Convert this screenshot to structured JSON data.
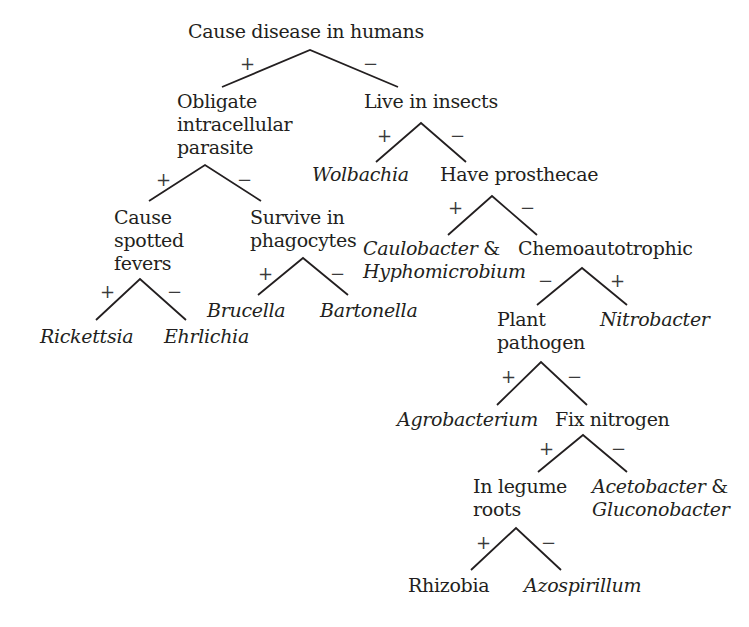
{
  "diagram": {
    "type": "binary-decision-tree",
    "title": "",
    "colors": {
      "text": "#231f20",
      "line": "#231f20",
      "background": "#ffffff"
    },
    "nodes": [
      {
        "id": "n_disease",
        "kind": "question",
        "lines": [
          "Cause disease in humans"
        ],
        "x": 188,
        "y": 20
      },
      {
        "id": "n_obligate",
        "kind": "question",
        "lines": [
          "Obligate",
          "intracellular",
          "parasite"
        ],
        "x": 177,
        "y": 90
      },
      {
        "id": "n_insects",
        "kind": "question",
        "lines": [
          "Live in insects"
        ],
        "x": 364,
        "y": 90
      },
      {
        "id": "n_wolbachia",
        "kind": "taxon",
        "lines": [
          "Wolbachia"
        ],
        "x": 312,
        "y": 163
      },
      {
        "id": "n_prosthecae",
        "kind": "question",
        "lines": [
          "Have prosthecae"
        ],
        "x": 440,
        "y": 163
      },
      {
        "id": "n_spotted",
        "kind": "question",
        "lines": [
          "Cause",
          "spotted",
          "fevers"
        ],
        "x": 114,
        "y": 206
      },
      {
        "id": "n_phagocytes",
        "kind": "question",
        "lines": [
          "Survive in",
          "phagocytes"
        ],
        "x": 250,
        "y": 206
      },
      {
        "id": "n_caulo",
        "kind": "taxon-pair",
        "lines": [
          "Caulobacter",
          "Hyphomicrobium"
        ],
        "suffix": " &",
        "x": 363,
        "y": 237
      },
      {
        "id": "n_chemo",
        "kind": "question",
        "lines": [
          "Chemoautotrophic"
        ],
        "x": 518,
        "y": 237
      },
      {
        "id": "n_brucella",
        "kind": "taxon",
        "lines": [
          "Brucella"
        ],
        "x": 207,
        "y": 299
      },
      {
        "id": "n_bartonella",
        "kind": "taxon",
        "lines": [
          "Bartonella"
        ],
        "x": 320,
        "y": 299
      },
      {
        "id": "n_plant",
        "kind": "question",
        "lines": [
          "Plant",
          "pathogen"
        ],
        "x": 497,
        "y": 308
      },
      {
        "id": "n_nitrobacter",
        "kind": "taxon",
        "lines": [
          "Nitrobacter"
        ],
        "x": 600,
        "y": 308
      },
      {
        "id": "n_rickettsia",
        "kind": "taxon",
        "lines": [
          "Rickettsia"
        ],
        "x": 40,
        "y": 325
      },
      {
        "id": "n_ehrlichia",
        "kind": "taxon",
        "lines": [
          "Ehrlichia"
        ],
        "x": 164,
        "y": 325
      },
      {
        "id": "n_agro",
        "kind": "taxon",
        "lines": [
          "Agrobacterium"
        ],
        "x": 397,
        "y": 408
      },
      {
        "id": "n_fix",
        "kind": "question",
        "lines": [
          "Fix nitrogen"
        ],
        "x": 555,
        "y": 408
      },
      {
        "id": "n_legume",
        "kind": "question",
        "lines": [
          "In legume",
          "roots"
        ],
        "x": 473,
        "y": 475
      },
      {
        "id": "n_aceto",
        "kind": "taxon-pair",
        "lines": [
          "Acetobacter",
          "Gluconobacter"
        ],
        "suffix": " &",
        "x": 592,
        "y": 475
      },
      {
        "id": "n_rhizobia",
        "kind": "group",
        "lines": [
          "Rhizobia"
        ],
        "x": 408,
        "y": 574
      },
      {
        "id": "n_azo",
        "kind": "taxon",
        "lines": [
          "Azospirillum"
        ],
        "x": 524,
        "y": 574
      }
    ],
    "forks": [
      {
        "parent": "n_disease",
        "apex": [
          310,
          50
        ],
        "left": [
          222,
          87
        ],
        "right": [
          398,
          87
        ],
        "left_sign": "+",
        "right_sign": "−",
        "left_child": "n_obligate",
        "right_child": "n_insects",
        "left_sign_pos": [
          240,
          55
        ],
        "right_sign_pos": [
          363,
          55
        ]
      },
      {
        "parent": "n_insects",
        "apex": [
          421,
          123
        ],
        "left": [
          376,
          162
        ],
        "right": [
          466,
          162
        ],
        "left_sign": "+",
        "right_sign": "−",
        "left_child": "n_wolbachia",
        "right_child": "n_prosthecae",
        "left_sign_pos": [
          377,
          127
        ],
        "right_sign_pos": [
          450,
          127
        ]
      },
      {
        "parent": "n_obligate",
        "apex": [
          205,
          165
        ],
        "left": [
          149,
          201
        ],
        "right": [
          261,
          201
        ],
        "left_sign": "+",
        "right_sign": "−",
        "left_child": "n_spotted",
        "right_child": "n_phagocytes",
        "left_sign_pos": [
          156,
          171
        ],
        "right_sign_pos": [
          237,
          171
        ]
      },
      {
        "parent": "n_prosthecae",
        "apex": [
          492,
          196
        ],
        "left": [
          448,
          235
        ],
        "right": [
          537,
          235
        ],
        "left_sign": "+",
        "right_sign": "−",
        "left_child": "n_caulo",
        "right_child": "n_chemo",
        "left_sign_pos": [
          448,
          199
        ],
        "right_sign_pos": [
          520,
          199
        ]
      },
      {
        "parent": "n_phagocytes",
        "apex": [
          303,
          258
        ],
        "left": [
          258,
          295
        ],
        "right": [
          348,
          295
        ],
        "left_sign": "+",
        "right_sign": "−",
        "left_child": "n_brucella",
        "right_child": "n_bartonella",
        "left_sign_pos": [
          258,
          265
        ],
        "right_sign_pos": [
          330,
          265
        ]
      },
      {
        "parent": "n_chemo",
        "apex": [
          582,
          268
        ],
        "left": [
          537,
          305
        ],
        "right": [
          627,
          305
        ],
        "left_sign": "−",
        "right_sign": "+",
        "left_child": "n_plant",
        "right_child": "n_nitrobacter",
        "left_sign_pos": [
          538,
          272
        ],
        "right_sign_pos": [
          610,
          272
        ]
      },
      {
        "parent": "n_spotted",
        "apex": [
          140,
          279
        ],
        "left": [
          96,
          320
        ],
        "right": [
          186,
          320
        ],
        "left_sign": "+",
        "right_sign": "−",
        "left_child": "n_rickettsia",
        "right_child": "n_ehrlichia",
        "left_sign_pos": [
          100,
          283
        ],
        "right_sign_pos": [
          167,
          283
        ]
      },
      {
        "parent": "n_plant",
        "apex": [
          541,
          362
        ],
        "left": [
          497,
          405
        ],
        "right": [
          587,
          405
        ],
        "left_sign": "+",
        "right_sign": "−",
        "left_child": "n_agro",
        "right_child": "n_fix",
        "left_sign_pos": [
          501,
          368
        ],
        "right_sign_pos": [
          567,
          368
        ]
      },
      {
        "parent": "n_fix",
        "apex": [
          583,
          435
        ],
        "left": [
          538,
          472
        ],
        "right": [
          627,
          472
        ],
        "left_sign": "+",
        "right_sign": "−",
        "left_child": "n_legume",
        "right_child": "n_aceto",
        "left_sign_pos": [
          539,
          440
        ],
        "right_sign_pos": [
          611,
          440
        ]
      },
      {
        "parent": "n_legume",
        "apex": [
          516,
          528
        ],
        "left": [
          471,
          570
        ],
        "right": [
          561,
          570
        ],
        "left_sign": "+",
        "right_sign": "−",
        "left_child": "n_rhizobia",
        "right_child": "n_azo",
        "left_sign_pos": [
          476,
          534
        ],
        "right_sign_pos": [
          541,
          534
        ]
      }
    ]
  }
}
